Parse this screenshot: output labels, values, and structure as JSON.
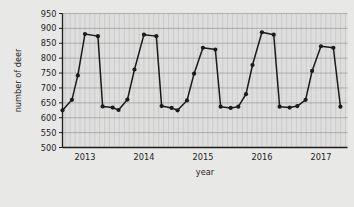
{
  "chart_data": {
    "type": "line",
    "title": "",
    "xlabel": "year",
    "ylabel": "number of deer",
    "ylim": [
      500,
      950
    ],
    "ytick_step": 50,
    "yticks": [
      500,
      550,
      600,
      650,
      700,
      750,
      800,
      850,
      900,
      950
    ],
    "xtick_labels": [
      "2013",
      "2014",
      "2015",
      "2016",
      "2017"
    ],
    "xtick_values": [
      2013,
      2014,
      2015,
      2016,
      2017
    ],
    "xlim": [
      2012.62,
      2017.45
    ],
    "grid": "minor vertical gridlines each month, horizontal gridlines at each 50 unit tick",
    "legend": "none",
    "marker": "filled circle",
    "line_color": "#1a1a1a",
    "plot_background": "#dedede",
    "page_background": "#e8e8e6",
    "series": [
      {
        "name": "number of deer",
        "points": [
          {
            "x": 2012.62,
            "y": 625
          },
          {
            "x": 2012.78,
            "y": 660
          },
          {
            "x": 2012.88,
            "y": 742
          },
          {
            "x": 2013.0,
            "y": 881
          },
          {
            "x": 2013.22,
            "y": 874
          },
          {
            "x": 2013.3,
            "y": 638
          },
          {
            "x": 2013.47,
            "y": 634
          },
          {
            "x": 2013.57,
            "y": 626
          },
          {
            "x": 2013.72,
            "y": 661
          },
          {
            "x": 2013.84,
            "y": 762
          },
          {
            "x": 2014.0,
            "y": 879
          },
          {
            "x": 2014.21,
            "y": 874
          },
          {
            "x": 2014.3,
            "y": 639
          },
          {
            "x": 2014.47,
            "y": 633
          },
          {
            "x": 2014.57,
            "y": 625
          },
          {
            "x": 2014.73,
            "y": 658
          },
          {
            "x": 2014.85,
            "y": 748
          },
          {
            "x": 2015.0,
            "y": 835
          },
          {
            "x": 2015.21,
            "y": 829
          },
          {
            "x": 2015.3,
            "y": 637
          },
          {
            "x": 2015.47,
            "y": 633
          },
          {
            "x": 2015.6,
            "y": 637
          },
          {
            "x": 2015.73,
            "y": 679
          },
          {
            "x": 2015.84,
            "y": 777
          },
          {
            "x": 2016.0,
            "y": 887
          },
          {
            "x": 2016.2,
            "y": 879
          },
          {
            "x": 2016.3,
            "y": 637
          },
          {
            "x": 2016.47,
            "y": 634
          },
          {
            "x": 2016.6,
            "y": 639
          },
          {
            "x": 2016.74,
            "y": 660
          },
          {
            "x": 2016.85,
            "y": 757
          },
          {
            "x": 2017.0,
            "y": 840
          },
          {
            "x": 2017.21,
            "y": 835
          },
          {
            "x": 2017.33,
            "y": 637
          }
        ]
      }
    ]
  }
}
